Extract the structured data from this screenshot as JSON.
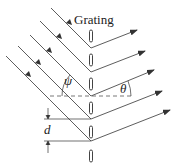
{
  "diagram": {
    "title": "Grating",
    "labels": {
      "incident_angle": "ψ",
      "diffracted_angle": "θ",
      "spacing": "d"
    },
    "colors": {
      "line": "#333333",
      "dashed": "#555555",
      "background": "#ffffff"
    },
    "geometry": {
      "grating_x": 91,
      "slat_centers_y": [
        36,
        60,
        84,
        108,
        132,
        156
      ],
      "reflection_points_y": [
        48,
        72,
        96,
        119,
        141
      ],
      "incident_direction_deg": 45,
      "diffracted_direction_deg": -20
    }
  }
}
